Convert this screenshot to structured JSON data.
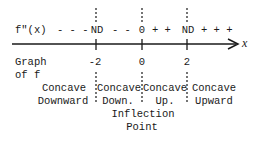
{
  "sign_row": {
    "label": "f\"(x)",
    "dashes_left": "- - -",
    "nd_left": "ND",
    "dashes_mid": "- -",
    "zero": "0",
    "plus_mid": "+ +",
    "nd_right": "ND",
    "plus_right": "+ + +"
  },
  "axis": {
    "label": "x",
    "ticks": [
      "-2",
      "0",
      "2"
    ]
  },
  "graph_label": {
    "line1": "Graph",
    "line2": "of f"
  },
  "intervals": [
    {
      "line1": "Concave",
      "line2": "Downward"
    },
    {
      "line1": "Concave",
      "line2": "Down."
    },
    {
      "line1": "Concave",
      "line2": "Up."
    },
    {
      "line1": "Concave",
      "line2": "Upward"
    }
  ],
  "inflection": {
    "line1": "Inflection",
    "line2": "Point"
  },
  "colors": {
    "ink": "#1a1a1a",
    "background": "#ffffff"
  }
}
